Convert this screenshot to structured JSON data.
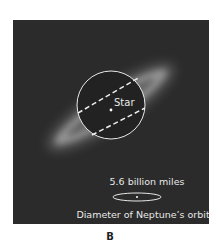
{
  "figure": {
    "panel_letter": "B",
    "star_label": "Star",
    "scale_label": "5.6 billion miles",
    "orbit_label": "Diameter of Neptune’s orbit",
    "colors": {
      "background": "#2b2b2b",
      "disk_glow": "#bdbdbd",
      "lines": "#eeeeee"
    }
  }
}
